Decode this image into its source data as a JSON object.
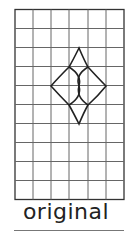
{
  "figure": {
    "label": "original",
    "grid": {
      "columns": 6,
      "rows": 10,
      "line_color": "#555555"
    },
    "shape": {
      "name": "curved diamond with inner lens",
      "stroke": "#222222"
    }
  }
}
